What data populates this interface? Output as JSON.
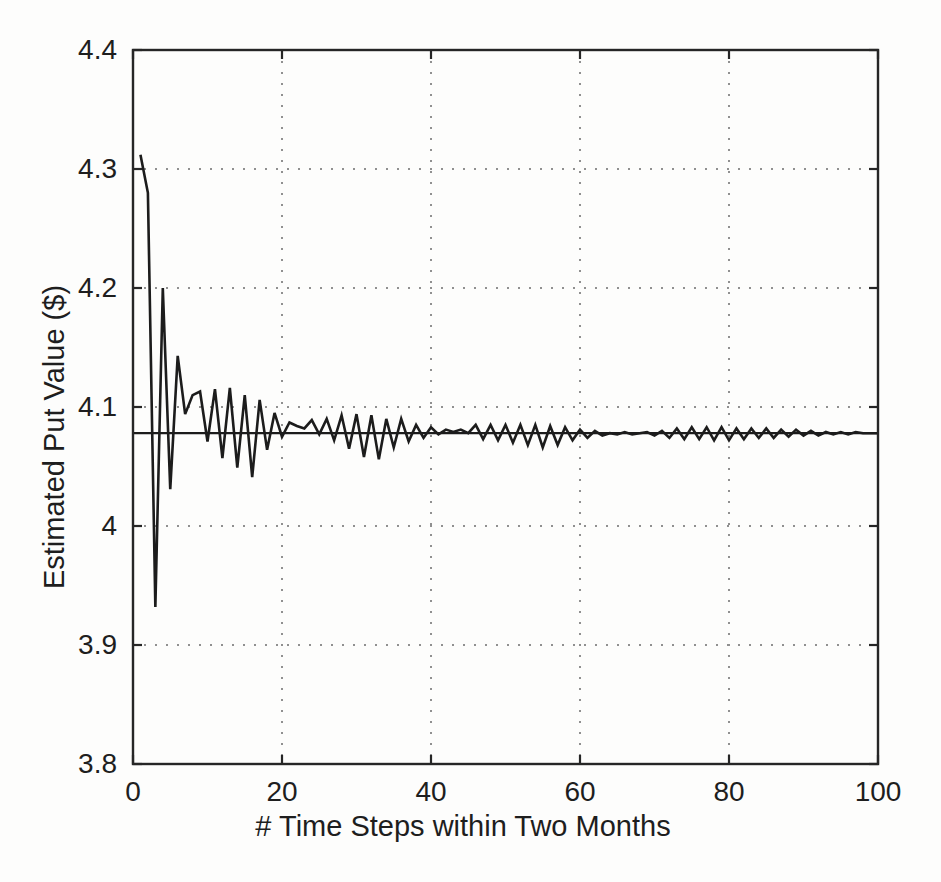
{
  "figure": {
    "width": 941,
    "height": 882,
    "background": "#fdfdfc",
    "ink_color": "#262626",
    "curve_color": "#1c1c1c",
    "grid_color": "#909090"
  },
  "chart_data": {
    "type": "line",
    "title": "",
    "xlabel": "# Time Steps within Two Months",
    "ylabel": "Estimated Put Value ($)",
    "xlim": [
      0,
      100
    ],
    "ylim": [
      3.8,
      4.4
    ],
    "x_ticks": [
      0,
      20,
      40,
      60,
      80,
      100
    ],
    "x_tick_labels": [
      "0",
      "20",
      "40",
      "60",
      "80",
      "100"
    ],
    "y_ticks": [
      3.8,
      3.9,
      4.0,
      4.1,
      4.2,
      4.3,
      4.4
    ],
    "y_tick_labels": [
      "3.8",
      "3.9",
      "4",
      "4.1",
      "4.2",
      "4.3",
      "4.4"
    ],
    "grid": "dotted",
    "legend": "none",
    "box": true,
    "series": [
      {
        "name": "binomial tree estimated put value",
        "type": "line",
        "x": [
          1,
          2,
          3,
          4,
          5,
          6,
          7,
          8,
          9,
          10,
          11,
          12,
          13,
          14,
          15,
          16,
          17,
          18,
          19,
          20,
          21,
          22,
          23,
          24,
          25,
          26,
          27,
          28,
          29,
          30,
          31,
          32,
          33,
          34,
          35,
          36,
          37,
          38,
          39,
          40,
          41,
          42,
          43,
          44,
          45,
          46,
          47,
          48,
          49,
          50,
          51,
          52,
          53,
          54,
          55,
          56,
          57,
          58,
          59,
          60,
          61,
          62,
          63,
          64,
          65,
          66,
          67,
          68,
          69,
          70,
          71,
          72,
          73,
          74,
          75,
          76,
          77,
          78,
          79,
          80,
          81,
          82,
          83,
          84,
          85,
          86,
          87,
          88,
          89,
          90,
          91,
          92,
          93,
          94,
          95,
          96,
          97,
          98,
          99,
          100
        ],
        "y": [
          4.312,
          4.28,
          3.932,
          4.2,
          4.031,
          4.143,
          4.094,
          4.11,
          4.113,
          4.071,
          4.115,
          4.057,
          4.116,
          4.049,
          4.11,
          4.041,
          4.106,
          4.064,
          4.095,
          4.075,
          4.087,
          4.084,
          4.082,
          4.089,
          4.077,
          4.09,
          4.072,
          4.093,
          4.065,
          4.094,
          4.058,
          4.093,
          4.056,
          4.09,
          4.066,
          4.09,
          4.071,
          4.085,
          4.074,
          4.083,
          4.077,
          4.081,
          4.079,
          4.081,
          4.078,
          4.085,
          4.073,
          4.085,
          4.072,
          4.085,
          4.07,
          4.085,
          4.068,
          4.085,
          4.066,
          4.084,
          4.068,
          4.083,
          4.072,
          4.081,
          4.074,
          4.08,
          4.076,
          4.078,
          4.077,
          4.079,
          4.077,
          4.078,
          4.079,
          4.076,
          4.08,
          4.074,
          4.082,
          4.073,
          4.083,
          4.073,
          4.083,
          4.072,
          4.083,
          4.072,
          4.082,
          4.073,
          4.082,
          4.074,
          4.082,
          4.074,
          4.081,
          4.075,
          4.081,
          4.076,
          4.08,
          4.076,
          4.079,
          4.077,
          4.079,
          4.077,
          4.079,
          4.078,
          4.078,
          4.078
        ]
      },
      {
        "name": "exact put value reference line",
        "type": "hline",
        "y": 4.078,
        "x_span": [
          0,
          100
        ]
      }
    ]
  }
}
